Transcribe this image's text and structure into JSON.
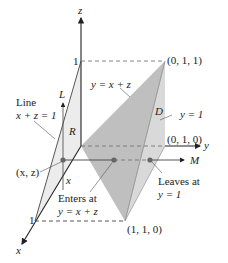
{
  "diagram": {
    "axes": {
      "x_label": "x",
      "y_label": "y",
      "z_label": "z",
      "x_tick": "1",
      "z_tick": "1"
    },
    "points": {
      "p011": "(0, 1, 1)",
      "p010": "(0, 1, 0)",
      "p110": "(1, 1, 0)",
      "xz": "(x, z)"
    },
    "labels": {
      "line_title": "Line",
      "line_eq": "x + z = 1",
      "L": "L",
      "R": "R",
      "D": "D",
      "M": "M",
      "x_marker": "x",
      "plane_slant": "y = x + z",
      "plane_right": "y = 1",
      "enters_1": "Enters at",
      "enters_2": "y = x + z",
      "leaves_1": "Leaves at",
      "leaves_2": "y = 1"
    },
    "colors": {
      "plane_dark": "#b8b8b8",
      "plane_light": "#d9d9d9",
      "region_R": "#ececec",
      "axis": "#222222",
      "dashed": "#777777",
      "dot": "#666666"
    }
  }
}
